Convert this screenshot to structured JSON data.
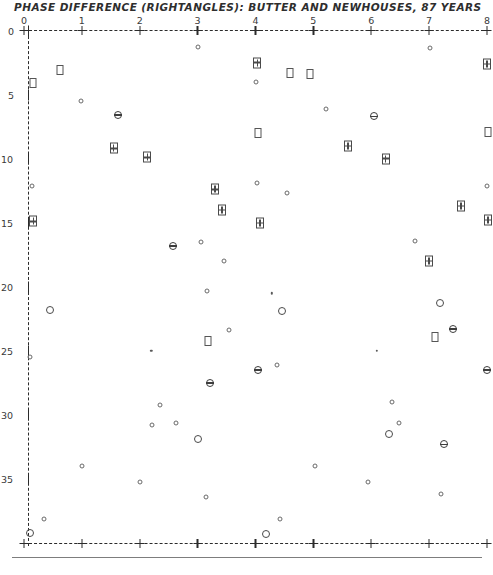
{
  "title": "PHASE DIFFERENCE (RIGHTANGLES):  BUTTER AND NEWHOUSES, 87 YEARS",
  "footer_caption": "",
  "axes": {
    "x_ticks": [
      "0",
      "1",
      "2",
      "3",
      "4",
      "5",
      "6",
      "7",
      "8"
    ],
    "y_ticks": [
      "0",
      "5",
      "10",
      "15",
      "20",
      "25",
      "30",
      "35"
    ]
  },
  "chart_data": {
    "type": "scatter",
    "title": "PHASE DIFFERENCE (RIGHTANGLES):  BUTTER AND NEWHOUSES, 87 YEARS",
    "xlabel": "",
    "ylabel": "",
    "xlim": [
      0,
      8
    ],
    "ylim": [
      40,
      0
    ],
    "x_ticks": [
      0,
      1,
      2,
      3,
      4,
      5,
      6,
      7,
      8
    ],
    "y_ticks": [
      0,
      5,
      10,
      15,
      20,
      25,
      30,
      35
    ],
    "grid": false,
    "legend": "none",
    "marker_types": [
      {
        "key": "circle-lg",
        "name": "large-open-circle"
      },
      {
        "key": "circle-sm",
        "name": "small-open-circle"
      },
      {
        "key": "dot",
        "name": "tiny-dot"
      },
      {
        "key": "circle-bar",
        "name": "circle-with-bar"
      },
      {
        "key": "square",
        "name": "open-square"
      },
      {
        "key": "square-x",
        "name": "crossed-square"
      }
    ],
    "points": [
      {
        "x": 3.01,
        "y": 1.3,
        "m": "circle-sm"
      },
      {
        "x": 7.02,
        "y": 1.4,
        "m": "circle-sm"
      },
      {
        "x": 4.03,
        "y": 2.5,
        "m": "square-x"
      },
      {
        "x": 8.0,
        "y": 2.6,
        "m": "square-x"
      },
      {
        "x": 0.63,
        "y": 3.1,
        "m": "square"
      },
      {
        "x": 4.6,
        "y": 3.3,
        "m": "square"
      },
      {
        "x": 0.16,
        "y": 4.1,
        "m": "square"
      },
      {
        "x": 4.0,
        "y": 4.0,
        "m": "circle-sm"
      },
      {
        "x": 4.95,
        "y": 3.4,
        "m": "square"
      },
      {
        "x": 0.98,
        "y": 5.5,
        "m": "circle-sm"
      },
      {
        "x": 5.22,
        "y": 6.1,
        "m": "circle-sm"
      },
      {
        "x": 1.62,
        "y": 6.6,
        "m": "circle-bar"
      },
      {
        "x": 6.05,
        "y": 6.7,
        "m": "circle-bar"
      },
      {
        "x": 4.05,
        "y": 8.0,
        "m": "square"
      },
      {
        "x": 8.02,
        "y": 7.9,
        "m": "square"
      },
      {
        "x": 1.55,
        "y": 9.2,
        "m": "square-x"
      },
      {
        "x": 5.6,
        "y": 9.0,
        "m": "square-x"
      },
      {
        "x": 2.13,
        "y": 9.9,
        "m": "square-x"
      },
      {
        "x": 6.25,
        "y": 10.0,
        "m": "square-x"
      },
      {
        "x": 0.14,
        "y": 12.1,
        "m": "circle-sm"
      },
      {
        "x": 4.02,
        "y": 11.9,
        "m": "circle-sm"
      },
      {
        "x": 3.3,
        "y": 12.4,
        "m": "square-x"
      },
      {
        "x": 4.55,
        "y": 12.7,
        "m": "circle-sm"
      },
      {
        "x": 8.0,
        "y": 12.1,
        "m": "circle-sm"
      },
      {
        "x": 3.42,
        "y": 14.0,
        "m": "square-x"
      },
      {
        "x": 7.55,
        "y": 13.7,
        "m": "square-x"
      },
      {
        "x": 0.16,
        "y": 14.9,
        "m": "square-x"
      },
      {
        "x": 4.08,
        "y": 15.0,
        "m": "square-x"
      },
      {
        "x": 8.02,
        "y": 14.8,
        "m": "square-x"
      },
      {
        "x": 2.58,
        "y": 16.8,
        "m": "circle-bar"
      },
      {
        "x": 3.05,
        "y": 16.5,
        "m": "circle-sm"
      },
      {
        "x": 6.75,
        "y": 16.4,
        "m": "circle-sm"
      },
      {
        "x": 3.45,
        "y": 18.0,
        "m": "circle-sm"
      },
      {
        "x": 7.0,
        "y": 18.0,
        "m": "square-x"
      },
      {
        "x": 3.16,
        "y": 20.3,
        "m": "circle-sm"
      },
      {
        "x": 4.28,
        "y": 20.5,
        "m": "dot"
      },
      {
        "x": 0.45,
        "y": 21.8,
        "m": "circle-lg"
      },
      {
        "x": 4.45,
        "y": 21.9,
        "m": "circle-lg"
      },
      {
        "x": 7.18,
        "y": 21.3,
        "m": "circle-lg"
      },
      {
        "x": 3.55,
        "y": 23.4,
        "m": "circle-sm"
      },
      {
        "x": 7.42,
        "y": 23.3,
        "m": "circle-bar"
      },
      {
        "x": 3.18,
        "y": 24.2,
        "m": "square"
      },
      {
        "x": 7.1,
        "y": 23.9,
        "m": "square"
      },
      {
        "x": 0.1,
        "y": 25.5,
        "m": "circle-sm"
      },
      {
        "x": 2.2,
        "y": 25.0,
        "m": "dot"
      },
      {
        "x": 6.1,
        "y": 25.0,
        "m": "dot"
      },
      {
        "x": 4.05,
        "y": 26.5,
        "m": "circle-bar"
      },
      {
        "x": 4.38,
        "y": 26.1,
        "m": "circle-sm"
      },
      {
        "x": 8.0,
        "y": 26.5,
        "m": "circle-bar"
      },
      {
        "x": 3.22,
        "y": 27.5,
        "m": "circle-bar"
      },
      {
        "x": 2.35,
        "y": 29.2,
        "m": "circle-sm"
      },
      {
        "x": 6.35,
        "y": 29.0,
        "m": "circle-sm"
      },
      {
        "x": 2.62,
        "y": 30.6,
        "m": "circle-sm"
      },
      {
        "x": 2.22,
        "y": 30.8,
        "m": "circle-sm"
      },
      {
        "x": 6.48,
        "y": 30.6,
        "m": "circle-sm"
      },
      {
        "x": 6.3,
        "y": 31.5,
        "m": "circle-lg"
      },
      {
        "x": 3.0,
        "y": 31.9,
        "m": "circle-lg"
      },
      {
        "x": 7.25,
        "y": 32.3,
        "m": "circle-bar"
      },
      {
        "x": 1.0,
        "y": 34.0,
        "m": "circle-sm"
      },
      {
        "x": 5.02,
        "y": 34.0,
        "m": "circle-sm"
      },
      {
        "x": 2.0,
        "y": 35.2,
        "m": "circle-sm"
      },
      {
        "x": 5.95,
        "y": 35.2,
        "m": "circle-sm"
      },
      {
        "x": 3.15,
        "y": 36.4,
        "m": "circle-sm"
      },
      {
        "x": 7.2,
        "y": 36.2,
        "m": "circle-sm"
      },
      {
        "x": 0.35,
        "y": 38.1,
        "m": "circle-sm"
      },
      {
        "x": 4.42,
        "y": 38.1,
        "m": "circle-sm"
      },
      {
        "x": 0.1,
        "y": 39.2,
        "m": "circle-lg"
      },
      {
        "x": 4.18,
        "y": 39.3,
        "m": "circle-lg"
      }
    ]
  }
}
